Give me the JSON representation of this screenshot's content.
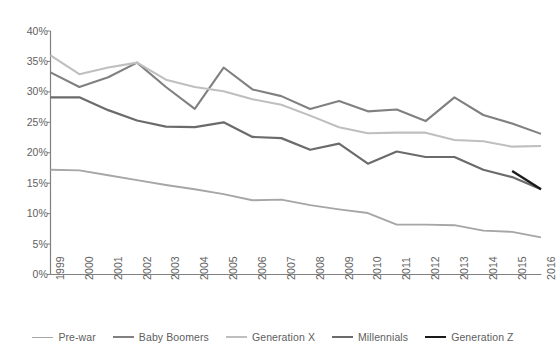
{
  "chart_data": {
    "type": "line",
    "title": "",
    "subtitle": "",
    "xlabel": "",
    "ylabel": "",
    "x": [
      1999,
      2000,
      2001,
      2002,
      2003,
      2004,
      2005,
      2006,
      2007,
      2008,
      2009,
      2010,
      2011,
      2012,
      2013,
      2014,
      2015,
      2016
    ],
    "xtick_labels": [
      "1999",
      "2000",
      "2001",
      "2002",
      "2003",
      "2004",
      "2005",
      "2006",
      "2007",
      "2008",
      "2009",
      "2010",
      "2011",
      "2012",
      "2013",
      "2014",
      "2015",
      "2016"
    ],
    "ytick_labels": [
      "40%",
      "35%",
      "30%",
      "25%",
      "20%",
      "15%",
      "10%",
      "5%",
      "0%"
    ],
    "ytick_values": [
      40,
      35,
      30,
      25,
      20,
      15,
      10,
      5,
      0
    ],
    "ylim": [
      0,
      40
    ],
    "y_unit": "%",
    "grid": false,
    "legend_position": "bottom",
    "series": [
      {
        "name": "Pre-war",
        "color": "#a6a6a6",
        "width": 1.9,
        "values": [
          17.2,
          17.1,
          16.3,
          15.5,
          14.7,
          14.0,
          13.2,
          12.2,
          12.3,
          11.4,
          10.7,
          10.1,
          8.2,
          8.2,
          8.1,
          7.2,
          7.0,
          6.1
        ]
      },
      {
        "name": "Baby Boomers",
        "color": "#808080",
        "width": 2.1,
        "values": [
          33.2,
          30.8,
          32.4,
          34.8,
          30.8,
          27.2,
          34.0,
          30.4,
          29.3,
          27.2,
          28.5,
          26.8,
          27.1,
          25.2,
          29.1,
          26.2,
          24.8,
          23.1
        ]
      },
      {
        "name": "Generation X",
        "color": "#bfbfbf",
        "width": 2.1,
        "values": [
          36.0,
          32.9,
          34.0,
          34.8,
          32.0,
          30.8,
          30.1,
          28.8,
          27.9,
          26.1,
          24.2,
          23.2,
          23.3,
          23.3,
          22.1,
          21.9,
          21.0,
          21.1
        ]
      },
      {
        "name": "Millennials",
        "color": "#6b6b6b",
        "width": 2.2,
        "values": [
          29.1,
          29.1,
          27.0,
          25.3,
          24.3,
          24.2,
          25.0,
          22.6,
          22.4,
          20.5,
          21.5,
          18.2,
          20.2,
          19.3,
          19.3,
          17.2,
          16.0,
          14.0
        ]
      },
      {
        "name": "Generation Z",
        "color": "#1a1a1a",
        "width": 2.4,
        "start_index": 16,
        "values": [
          null,
          null,
          null,
          null,
          null,
          null,
          null,
          null,
          null,
          null,
          null,
          null,
          null,
          null,
          null,
          null,
          17.0,
          14.0
        ]
      }
    ]
  },
  "legend": {
    "items": [
      {
        "label": "Pre-war",
        "color": "#a6a6a6",
        "width": 1.9
      },
      {
        "label": "Baby Boomers",
        "color": "#808080",
        "width": 2.1
      },
      {
        "label": "Generation X",
        "color": "#bfbfbf",
        "width": 2.1
      },
      {
        "label": "Millennials",
        "color": "#6b6b6b",
        "width": 2.2
      },
      {
        "label": "Generation Z",
        "color": "#1a1a1a",
        "width": 2.4
      }
    ]
  },
  "axes": {
    "axis_color": "#808080",
    "axis_line_width": 1.2
  }
}
